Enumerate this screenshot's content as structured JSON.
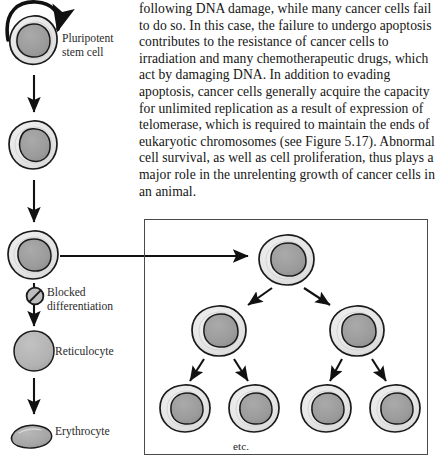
{
  "page": {
    "width": 438,
    "height": 462,
    "background": "#ffffff"
  },
  "body_text": {
    "paragraph": "following DNA damage, while many cancer cells fail to do so. In this case, the failure to undergo apoptosis contributes to the resistance of cancer cells to irradiation and many chemotherapeutic drugs, which act by damaging DNA. In addition to evading apoptosis, cancer cells generally acquire the capacity for unlimited replication as a result of expression of telomerase, which is required to maintain the ends of eukaryotic chromosomes (see Figure 5.17). Abnormal cell survival, as well as cell proliferation, thus plays a major role in the unrelenting growth of cancer cells in an animal."
  },
  "diagram": {
    "lineage_labels": {
      "pluripotent_stem_cell": "Pluripotent\nstem cell",
      "blocked_differentiation": "Blocked\ndifferentiation",
      "reticulocyte": "Reticulocyte",
      "erythrocyte": "Erythrocyte"
    },
    "clone_box": {
      "etc_label": "etc.",
      "rows": [
        1,
        2,
        4
      ]
    },
    "colors": {
      "cytoplasm": "#e9e9e9",
      "cytoplasm_inner": "#dedede",
      "nucleus": "#9c9c9c",
      "outline": "#1a1a1a",
      "arrow": "#111111",
      "box_border": "#4a4a4a",
      "erythrocyte_fill": "#a8a8a8",
      "reticulocyte_fill": "#b4b4b4"
    },
    "icons": {
      "self_renewal": "curved-loop-arrow-icon",
      "blocked": "no-entry-slash-icon",
      "down_arrow": "arrow-down-icon",
      "right_arrow": "arrow-right-icon",
      "branch_arrow": "arrow-diagonal-icon"
    }
  }
}
